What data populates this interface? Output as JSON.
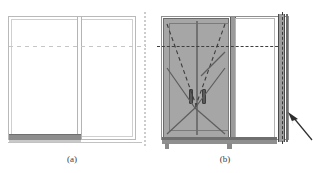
{
  "figure": {
    "type": "technical-line-drawing",
    "subfigures": [
      {
        "id": "a",
        "caption": "(a)",
        "label": "(a)",
        "elements": [
          "outer-frame",
          "inner-frame-line",
          "vertical-mullion",
          "bottom-sill-bar",
          "horizontal-dashed-reference-line",
          "right-dotted-edge-line"
        ]
      },
      {
        "id": "b",
        "caption": "(b)",
        "label": "(b)",
        "elements": [
          "outer-frame",
          "shaded-double-door-leaf",
          "door-leaf-split-line",
          "door-swing-dashed-lines",
          "door-diagonal-panel-lines",
          "door-handle-left",
          "door-handle-right",
          "vertical-mullion",
          "clear-glass-panel",
          "right-jamb-post",
          "bottom-sill-bar",
          "horizontal-dashed-reference-line",
          "vertical-dashed-reference-line",
          "callout-arrow"
        ]
      }
    ],
    "annotation_arrow": {
      "name": "callout-arrow",
      "points_to": "right-jamb-post",
      "direction": "up-left"
    }
  },
  "colors": {
    "door_fill": "#a6a6a6",
    "frame_line": "#8f8f8f",
    "light_frame_line": "#b9b9b9",
    "dark_line": "#5a5a5a",
    "dash_line": "#3f3f3f",
    "background": "#ffffff",
    "caption_text": "#3a3a3a"
  }
}
